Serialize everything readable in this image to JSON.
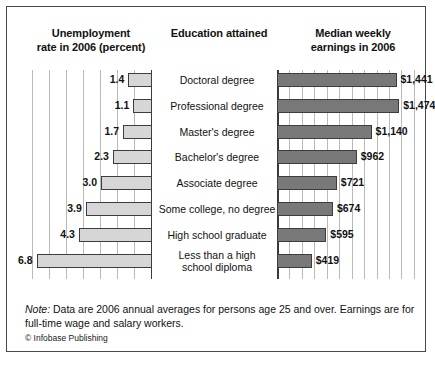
{
  "headers": {
    "left": "Unemployment\nrate in 2006 (percent)",
    "middle": "Education attained",
    "right": "Median weekly\nearnings in 2006"
  },
  "note": {
    "label": "Note:",
    "text": " Data are 2006 annual averages for persons age 25 and over. Earnings are for full-time wage and salary workers.",
    "credit": "© Infobase Publishing"
  },
  "colors": {
    "unemployment_bar": "#d6d6d6",
    "earnings_bar": "#787878",
    "bar_border": "#3d3d3d",
    "gridline": "#b9b9b9",
    "axis": "#3a3a3a",
    "frame": "#4a4a4a"
  },
  "chart_data": {
    "type": "bar",
    "orientation": "horizontal",
    "layout": "paired-opposed bars with shared category axis in the centre",
    "grid": true,
    "legend_position": "none",
    "categories": [
      "Doctoral degree",
      "Professional degree",
      "Master's degree",
      "Bachelor's degree",
      "Associate degree",
      "Some college, no degree",
      "High school graduate",
      "Less than a high school diploma"
    ],
    "category_lines": [
      [
        "Doctoral degree"
      ],
      [
        "Professional degree"
      ],
      [
        "Master's degree"
      ],
      [
        "Bachelor's degree"
      ],
      [
        "Associate degree"
      ],
      [
        "Some college, no degree"
      ],
      [
        "High school graduate"
      ],
      [
        "Less than a high",
        "school diploma"
      ]
    ],
    "series": [
      {
        "name": "Unemployment rate in 2006 (percent)",
        "side": "left",
        "direction": "right-to-left",
        "unit": "percent",
        "values": [
          1.4,
          1.1,
          1.7,
          2.3,
          3.0,
          3.9,
          4.3,
          6.8
        ],
        "labels": [
          "1.4",
          "1.1",
          "1.7",
          "2.3",
          "3.0",
          "3.9",
          "4.3",
          "6.8"
        ],
        "xlim": [
          0,
          7.3
        ],
        "gridline_step": 1
      },
      {
        "name": "Median weekly earnings in 2006",
        "side": "right",
        "direction": "left-to-right",
        "unit": "US dollars",
        "values": [
          1441,
          1474,
          1140,
          962,
          721,
          674,
          595,
          419
        ],
        "labels": [
          "$1,441",
          "$1,474",
          "$1,140",
          "$962",
          "$721",
          "$674",
          "$595",
          "$419"
        ],
        "xlim": [
          0,
          1700
        ],
        "gridline_step": 150
      }
    ],
    "xlabel": "",
    "ylabel": ""
  }
}
